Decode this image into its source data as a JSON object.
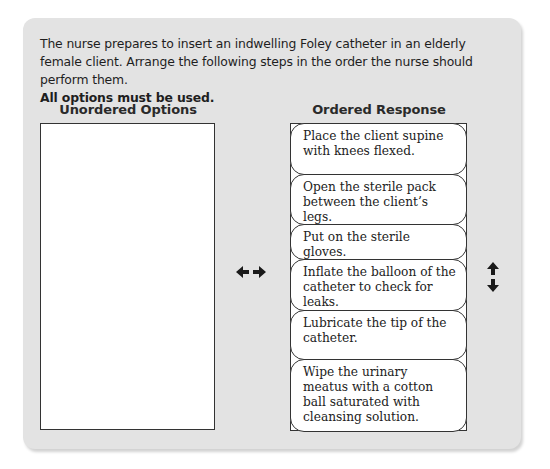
{
  "question": {
    "prompt": "The nurse prepares to insert an indwelling Foley catheter in an elderly female client. Arrange the following steps in the order the nurse should perform them.",
    "instruction": "All options must be used."
  },
  "unordered": {
    "header": "Unordered Options",
    "items": []
  },
  "ordered": {
    "header": "Ordered Response",
    "items": [
      {
        "label": "Place the client supine with knees flexed."
      },
      {
        "label": "Open the sterile pack between the client’s legs."
      },
      {
        "label": "Put on the sterile gloves."
      },
      {
        "label": "Inflate the balloon of the catheter to check for leaks."
      },
      {
        "label": "Lubricate the tip of the catheter."
      },
      {
        "label": "Wipe the urinary meatus with a cotton ball saturated with cleansing solution."
      }
    ]
  },
  "controls": {
    "move_icon": "left-right-arrow",
    "reorder_icon": "up-down-arrow"
  }
}
